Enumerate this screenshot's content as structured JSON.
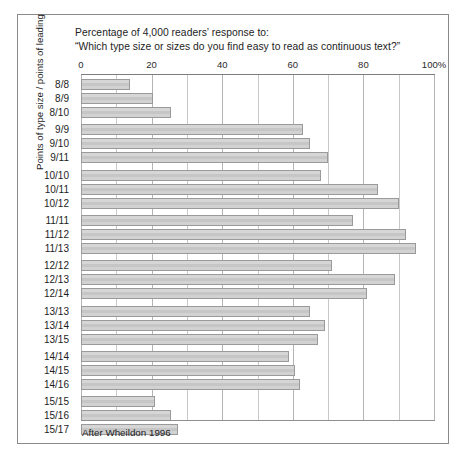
{
  "figure": {
    "title_line1": "Percentage of 4,000 readers’ response to:",
    "title_line2": "“Which type size or sizes do you find easy to read as continuous text?”",
    "y_axis_title": "Points of type size / points of leading",
    "source_note": "After Wheildon 1996",
    "colors": {
      "bar_fill": "#cdcdcd",
      "bar_stroke": "#9a9a9a",
      "gridline": "#c9c9c9",
      "axis": "#7d7d7d",
      "frame": "#8a8a8a",
      "text": "#1d1d1d"
    }
  },
  "chart_data": {
    "type": "bar",
    "orientation": "horizontal",
    "title": "Percentage of 4,000 readers’ response to: “Which type size or sizes do you find easy to read as continuous text?”",
    "xlabel": "",
    "ylabel": "Points of type size / points of leading",
    "xlim": [
      0,
      100
    ],
    "grid": true,
    "legend": null,
    "annotations": [
      "After Wheildon 1996"
    ],
    "tick_labels": [
      "0",
      "20",
      "40",
      "60",
      "80",
      "100%"
    ],
    "tick_values": [
      0,
      20,
      40,
      60,
      80,
      100
    ],
    "minor_tick_values": [
      10,
      30,
      50,
      70,
      90
    ],
    "categories": [
      "8/8",
      "8/9",
      "8/10",
      "9/9",
      "9/10",
      "9/11",
      "10/10",
      "10/11",
      "10/12",
      "11/11",
      "11/12",
      "11/13",
      "12/12",
      "12/13",
      "12/14",
      "13/13",
      "13/14",
      "13/15",
      "14/14",
      "14/15",
      "14/16",
      "15/15",
      "15/16",
      "15/17"
    ],
    "values": [
      14,
      20.5,
      25.5,
      63,
      65,
      70,
      68,
      84,
      90,
      77,
      92,
      95,
      71,
      89,
      81,
      65,
      69,
      67,
      59,
      60.5,
      62,
      21,
      25.5,
      27.5
    ],
    "group_breaks_after": [
      "8/10",
      "9/11",
      "10/12",
      "11/13",
      "12/14",
      "13/15",
      "14/16"
    ]
  }
}
